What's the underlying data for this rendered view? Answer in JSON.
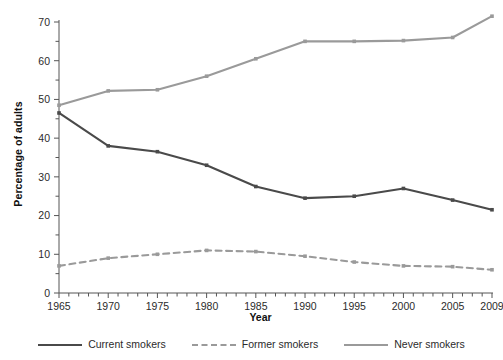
{
  "chart_data": {
    "type": "line",
    "title": "",
    "xlabel": "Year",
    "ylabel": "Percentage of adults",
    "x": [
      1965,
      1970,
      1975,
      1980,
      1985,
      1990,
      1995,
      2000,
      2005,
      2009
    ],
    "xlim": [
      1965,
      2009
    ],
    "ylim": [
      0,
      70
    ],
    "xticks": [
      "1965",
      "1970",
      "1975",
      "1980",
      "1985",
      "1990",
      "1995",
      "2000",
      "2005",
      "2009"
    ],
    "yticks": [
      "0",
      "10",
      "20",
      "30",
      "40",
      "50",
      "60",
      "70"
    ],
    "y_major_step": 10,
    "y_minor_step": 5,
    "x_minor_step": 1,
    "grid": false,
    "legend_position": "bottom",
    "series": [
      {
        "name": "Current smokers",
        "color": "#4a4a4a",
        "style": "solid",
        "marker": "square",
        "values": [
          46.5,
          38.0,
          36.5,
          33.0,
          27.5,
          24.5,
          25.0,
          27.0,
          24.0,
          21.5
        ]
      },
      {
        "name": "Former smokers",
        "color": "#9a9a9a",
        "style": "dashed",
        "marker": "square",
        "values": [
          7.0,
          9.0,
          10.0,
          11.0,
          10.7,
          9.5,
          8.0,
          7.0,
          6.8,
          6.0
        ]
      },
      {
        "name": "Never smokers",
        "color": "#9a9a9a",
        "style": "solid",
        "marker": "square",
        "values": [
          48.5,
          52.2,
          52.5,
          56.0,
          60.5,
          65.0,
          65.0,
          65.2,
          66.0,
          71.5
        ]
      }
    ]
  },
  "legend": {
    "items": [
      {
        "label": "Current smokers"
      },
      {
        "label": "Former smokers"
      },
      {
        "label": "Never smokers"
      }
    ]
  },
  "axes": {
    "x_title": "Year",
    "y_title": "Percentage of adults"
  }
}
